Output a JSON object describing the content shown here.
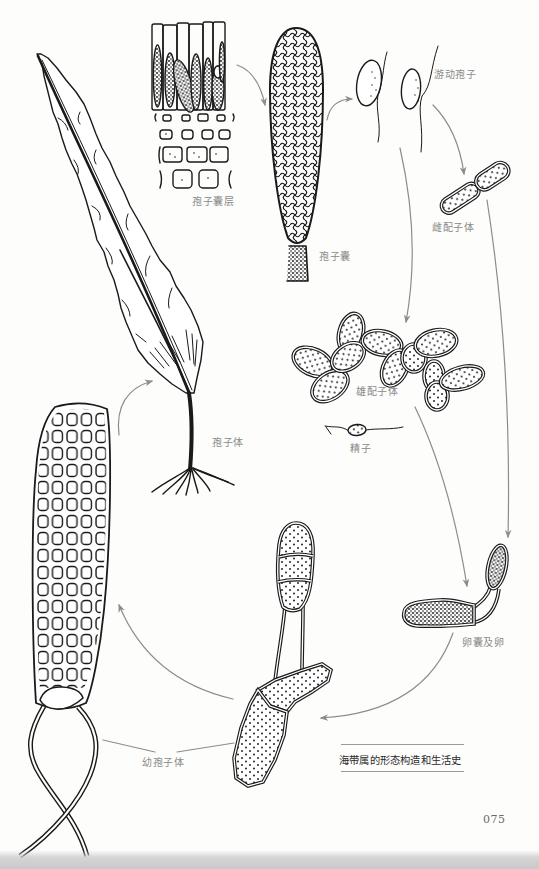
{
  "figure": {
    "caption": "海带属的形态构造和生活史",
    "page_number": "075",
    "labels": {
      "sporangial_layer": "孢子囊层",
      "sporangium": "孢子囊",
      "zoospores": "游动孢子",
      "female_gametophyte": "雌配子体",
      "male_gametophyte": "雄配子体",
      "sperm": "精子",
      "sporophyte": "孢子体",
      "oogonium_and_egg": "卵囊及卵",
      "young_sporophyte": "幼孢子体"
    },
    "life_cycle_sequence": [
      "孢子体",
      "孢子囊层",
      "孢子囊",
      "游动孢子",
      "雌配子体",
      "雄配子体",
      "精子",
      "卵囊及卵",
      "幼孢子体"
    ]
  },
  "colors": {
    "ink": "#1a1a1a",
    "arrow": "#8c8c8c",
    "label": "#8a8a8a",
    "caption": "#2a2a2a"
  }
}
